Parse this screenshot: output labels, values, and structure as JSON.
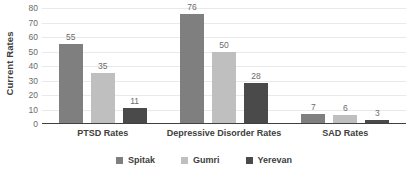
{
  "chart_data": {
    "type": "bar",
    "title": "",
    "subtitle": "",
    "xlabel": "",
    "ylabel": "Current Rates",
    "ylim": [
      0,
      80
    ],
    "yticks": [
      0,
      10,
      20,
      30,
      40,
      50,
      60,
      70,
      80
    ],
    "ytick_labels": [
      "0",
      "10",
      "20",
      "30",
      "40",
      "50",
      "60",
      "70",
      "80"
    ],
    "grid": true,
    "grid_axis": "y",
    "legend_position": "bottom-center",
    "orientation": "vertical",
    "grouping": "clustered",
    "show_data_labels": true,
    "categories": [
      "PTSD Rates",
      "Depressive Disorder Rates",
      "SAD Rates"
    ],
    "series": [
      {
        "name": "Spitak",
        "color": "#7f7f7f",
        "values": [
          55,
          76,
          7
        ],
        "labels": [
          "55",
          "76",
          "7"
        ]
      },
      {
        "name": "Gumri",
        "color": "#bfbfbf",
        "values": [
          35,
          50,
          6
        ],
        "labels": [
          "35",
          "50",
          "6"
        ]
      },
      {
        "name": "Yerevan",
        "color": "#4a4a4a",
        "values": [
          11,
          28,
          3
        ],
        "labels": [
          "11",
          "28",
          "3"
        ]
      }
    ]
  },
  "style": {
    "background": "#ffffff",
    "gridline_color": "#e9e9e9",
    "axis_color": "#404040",
    "tick_label_color": "#6b6b6b",
    "data_label_color": "#6b6b6b",
    "category_label_color": "#404040"
  }
}
